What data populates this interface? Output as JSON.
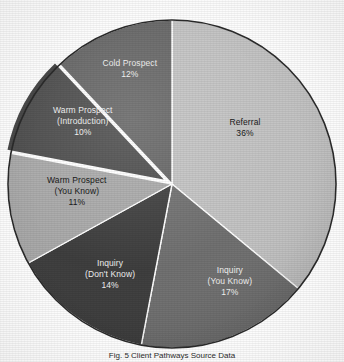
{
  "figure": {
    "caption": "Fig. 5 Client Pathways Source Data"
  },
  "chart_data": {
    "type": "pie",
    "title": "",
    "subtitle": "",
    "xlabel": "",
    "ylabel": "",
    "legend_position": "none",
    "grid": false,
    "units": "percent",
    "total": 100,
    "start_angle_deg": 0,
    "direction": "clockwise",
    "center": {
      "x": 172,
      "y": 184
    },
    "radius": 164,
    "categories": [
      "Referral",
      "Inquiry (You Know)",
      "Inquiry (Don't Know)",
      "Warm Prospect (You Know)",
      "Warm Prospect (Introduction)",
      "Cold Prospect"
    ],
    "values": [
      36,
      17,
      14,
      11,
      10,
      12
    ],
    "slices": [
      {
        "name": "Referral",
        "label_lines": [
          "Referral",
          "36%"
        ],
        "value": 36,
        "percent_text": "36%",
        "color": "#c2c2c2",
        "label_color": "#1a1a1a",
        "exploded": false,
        "start_deg": 0,
        "end_deg": 129.6,
        "label_pos": {
          "x": 245,
          "y": 128
        }
      },
      {
        "name": "Inquiry (You Know)",
        "label_lines": [
          "Inquiry",
          "(You Know)",
          "17%"
        ],
        "value": 17,
        "percent_text": "17%",
        "color": "#6e6e6e",
        "label_color": "#f2f2f2",
        "exploded": false,
        "start_deg": 129.6,
        "end_deg": 190.8,
        "label_pos": {
          "x": 230,
          "y": 281
        }
      },
      {
        "name": "Inquiry (Don't Know)",
        "label_lines": [
          "Inquiry",
          "(Don't Know)",
          "14%"
        ],
        "value": 14,
        "percent_text": "14%",
        "color": "#3b3b3b",
        "label_color": "#f2f2f2",
        "exploded": false,
        "start_deg": 190.8,
        "end_deg": 241.2,
        "label_pos": {
          "x": 110,
          "y": 274
        }
      },
      {
        "name": "Warm Prospect (You Know)",
        "label_lines": [
          "Warm Prospect",
          "(You Know)",
          "11%"
        ],
        "value": 11,
        "percent_text": "11%",
        "color": "#a8a8a8",
        "label_color": "#1a1a1a",
        "exploded": false,
        "start_deg": 241.2,
        "end_deg": 280.8,
        "label_pos": {
          "x": 77,
          "y": 191
        }
      },
      {
        "name": "Warm Prospect (Introduction)",
        "label_lines": [
          "Warm Prospect",
          "(Introduction)",
          "10%"
        ],
        "value": 10,
        "percent_text": "10%",
        "color": "#4a4a4a",
        "label_color": "#f2f2f2",
        "exploded": true,
        "start_deg": 280.8,
        "end_deg": 316.8,
        "label_pos": {
          "x": 83,
          "y": 121
        }
      },
      {
        "name": "Cold Prospect",
        "label_lines": [
          "Cold Prospect",
          "12%"
        ],
        "value": 12,
        "percent_text": "12%",
        "color": "#636363",
        "label_color": "#f2f2f2",
        "exploded": false,
        "start_deg": 316.8,
        "end_deg": 360,
        "label_pos": {
          "x": 130,
          "y": 69
        }
      }
    ]
  },
  "colors": {
    "background": "#ffffff",
    "outline": "#2b2b2b",
    "separator": "#ffffff"
  }
}
